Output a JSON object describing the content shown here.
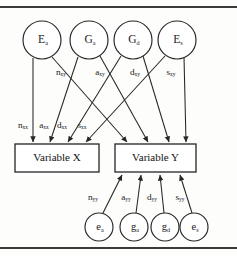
{
  "figure": {
    "background_color": "#fdfdfc",
    "line_color": "#262626",
    "rule_color": "#3a3a3a"
  },
  "top_nodes": [
    {
      "id": "top-node-ea",
      "base": "E",
      "subscript": "a",
      "cx": 42,
      "cy": 40,
      "r": 19
    },
    {
      "id": "top-node-ga",
      "base": "G",
      "subscript": "a",
      "cx": 89,
      "cy": 40,
      "r": 19
    },
    {
      "id": "top-node-gd",
      "base": "G",
      "subscript": "d",
      "cx": 133,
      "cy": 40,
      "r": 19
    },
    {
      "id": "top-node-es",
      "base": "E",
      "subscript": "s",
      "cx": 177,
      "cy": 40,
      "r": 19
    }
  ],
  "bottom_nodes": [
    {
      "id": "bottom-node-ea",
      "base": "e",
      "subscript": "a",
      "cx": 99,
      "cy": 227,
      "r": 14
    },
    {
      "id": "bottom-node-ga",
      "base": "g",
      "subscript": "a",
      "cx": 134,
      "cy": 227,
      "r": 14
    },
    {
      "id": "bottom-node-gd",
      "base": "g",
      "subscript": "d",
      "cx": 165,
      "cy": 227,
      "r": 14
    },
    {
      "id": "bottom-node-es",
      "base": "e",
      "subscript": "s",
      "cx": 194,
      "cy": 227,
      "r": 14
    }
  ],
  "boxes": [
    {
      "id": "box-variable-x",
      "label": "Variable X",
      "x": 15,
      "y": 144,
      "width": 84,
      "height": 28
    },
    {
      "id": "box-variable-y",
      "label": "Variable Y",
      "x": 115,
      "y": 144,
      "width": 81,
      "height": 28
    }
  ],
  "direct_paths_x": [
    {
      "id": "path-nxx",
      "base": "n",
      "subscript": "xx",
      "from": "top-node-ea",
      "to": "box-variable-x",
      "x1": 33,
      "y1": 58,
      "x2": 33,
      "y2": 142,
      "label_x": 23,
      "label_y": 126
    },
    {
      "id": "path-axx",
      "base": "a",
      "subscript": "xx",
      "from": "top-node-ga",
      "to": "box-variable-x",
      "x1": 78,
      "y1": 57,
      "x2": 50,
      "y2": 142,
      "label_x": 44,
      "label_y": 126
    },
    {
      "id": "path-dxx",
      "base": "d",
      "subscript": "xx",
      "from": "top-node-gd",
      "to": "box-variable-x",
      "x1": 121,
      "y1": 56,
      "x2": 68,
      "y2": 142,
      "label_x": 62,
      "label_y": 126
    },
    {
      "id": "path-sxx",
      "base": "s",
      "subscript": "xx",
      "from": "top-node-es",
      "to": "box-variable-x",
      "x1": 165,
      "y1": 56,
      "x2": 86,
      "y2": 142,
      "label_x": 82,
      "label_y": 126
    }
  ],
  "cross_paths_y": [
    {
      "id": "path-nxy",
      "base": "n",
      "subscript": "xy",
      "from": "top-node-ea",
      "to": "box-variable-y",
      "x1": 52,
      "y1": 57,
      "x2": 127,
      "y2": 142,
      "label_x": 61,
      "label_y": 73
    },
    {
      "id": "path-axy",
      "base": "a",
      "subscript": "xy",
      "from": "top-node-ga",
      "to": "box-variable-y",
      "x1": 100,
      "y1": 56,
      "x2": 148,
      "y2": 142,
      "label_x": 100,
      "label_y": 73
    },
    {
      "id": "path-dxy",
      "base": "d",
      "subscript": "xy",
      "from": "top-node-gd",
      "to": "box-variable-y",
      "x1": 143,
      "y1": 56,
      "x2": 169,
      "y2": 142,
      "label_x": 135,
      "label_y": 73
    },
    {
      "id": "path-sxy",
      "base": "s",
      "subscript": "xy",
      "from": "top-node-es",
      "to": "box-variable-y",
      "x1": 184,
      "y1": 57,
      "x2": 186,
      "y2": 142,
      "label_x": 171,
      "label_y": 73
    }
  ],
  "residual_paths_y": [
    {
      "id": "path-nyy",
      "base": "n",
      "subscript": "yy",
      "from": "bottom-node-ea",
      "to": "box-variable-y",
      "x1": 103,
      "y1": 213,
      "x2": 122,
      "y2": 175,
      "label_x": 93,
      "label_y": 198
    },
    {
      "id": "path-ayy",
      "base": "a",
      "subscript": "yy",
      "from": "bottom-node-ga",
      "to": "box-variable-y",
      "x1": 136,
      "y1": 213,
      "x2": 141,
      "y2": 175,
      "label_x": 126,
      "label_y": 198
    },
    {
      "id": "path-dyy",
      "base": "d",
      "subscript": "yy",
      "from": "bottom-node-gd",
      "to": "box-variable-y",
      "x1": 164,
      "y1": 213,
      "x2": 160,
      "y2": 175,
      "label_x": 152,
      "label_y": 198
    },
    {
      "id": "path-syy",
      "base": "s",
      "subscript": "yy",
      "from": "bottom-node-es",
      "to": "box-variable-y",
      "x1": 192,
      "y1": 213,
      "x2": 180,
      "y2": 175,
      "label_x": 180,
      "label_y": 198
    }
  ]
}
